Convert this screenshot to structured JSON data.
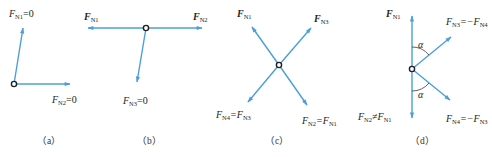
{
  "colors": {
    "force_arrow": "#4a9fd8",
    "node": "#231f20",
    "text": "#231f20"
  },
  "panels": [
    {
      "id": "a",
      "caption": "（a）",
      "labels": [
        {
          "main": "F",
          "sub": "N1",
          "suffix": "=0",
          "bold": false
        },
        {
          "main": "F",
          "sub": "N2",
          "suffix": "=0",
          "bold": false
        }
      ]
    },
    {
      "id": "b",
      "caption": "（b）",
      "labels": [
        {
          "main": "F",
          "sub": "N1",
          "suffix": "",
          "bold": true
        },
        {
          "main": "F",
          "sub": "N2",
          "suffix": "",
          "bold": true
        },
        {
          "main": "F",
          "sub": "N3",
          "suffix": "=0",
          "bold": false
        }
      ]
    },
    {
      "id": "c",
      "caption": "（c）",
      "labels": [
        {
          "main": "F",
          "sub": "N1",
          "suffix": "",
          "bold": true
        },
        {
          "main": "F",
          "sub": "N3",
          "suffix": "",
          "bold": true
        },
        {
          "main": "F",
          "sub": "N4",
          "mid": "=F",
          "sub2": "N3",
          "bold": false
        },
        {
          "main": "F",
          "sub": "N2",
          "mid": "=F",
          "sub2": "N1",
          "bold": false
        }
      ]
    },
    {
      "id": "d",
      "caption": "（d）",
      "angle_symbol": "α",
      "labels": [
        {
          "main": "F",
          "sub": "N1",
          "suffix": "",
          "bold": true
        },
        {
          "main": "F",
          "sub": "N3",
          "mid": "=−F",
          "sub2": "N4",
          "bold": false
        },
        {
          "main": "F",
          "sub": "N2",
          "mid": "≠F",
          "sub2": "N1",
          "bold": false
        },
        {
          "main": "F",
          "sub": "N4",
          "mid": "=−F",
          "sub2": "N3",
          "bold": false
        }
      ]
    }
  ]
}
